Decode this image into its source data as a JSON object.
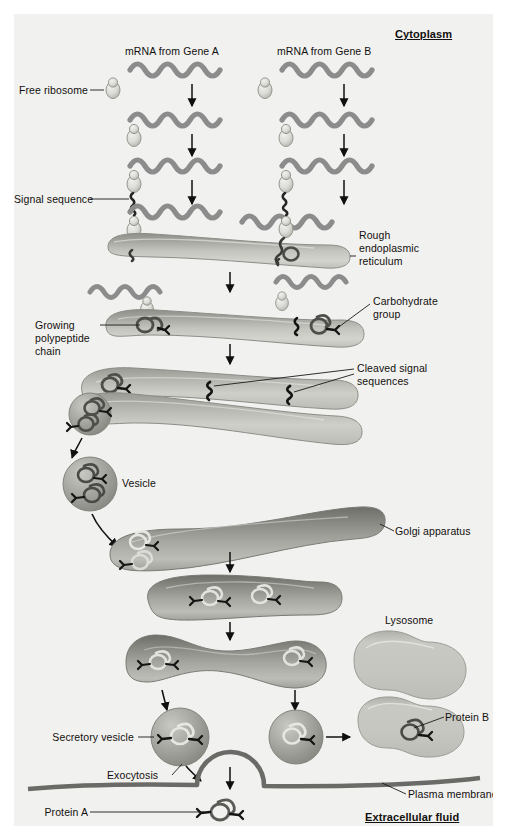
{
  "figure": {
    "type": "biology-process-diagram",
    "background_color": "#f1f1ef",
    "canvas": {
      "width": 507,
      "height": 838
    }
  },
  "regions": {
    "cytoplasm_label": "Cytoplasm",
    "extracellular_label": "Extracellular fluid"
  },
  "labels": {
    "mrna_gene_a": "mRNA from Gene A",
    "mrna_gene_b": "mRNA from Gene B",
    "free_ribosome": "Free ribosome",
    "signal_sequence": "Signal sequence",
    "rough_er_line1": "Rough",
    "rough_er_line2": "endoplasmic",
    "rough_er_line3": "reticulum",
    "carbohydrate_line1": "Carbohydrate",
    "carbohydrate_line2": "group",
    "growing_line1": "Growing",
    "growing_line2": "polypeptide",
    "growing_line3": "chain",
    "cleaved_line1": "Cleaved signal",
    "cleaved_line2": "sequences",
    "vesicle": "Vesicle",
    "golgi": "Golgi apparatus",
    "lysosome": "Lysosome",
    "secretory_vesicle": "Secretory vesicle",
    "protein_b": "Protein B",
    "exocytosis": "Exocytosis",
    "plasma_membrane": "Plasma membrane",
    "protein_a": "Protein A"
  },
  "colors": {
    "background": "#f1f1ef",
    "mrna": "#8c8c8c",
    "mrna_dark": "#6f6f6f",
    "ribosome": "#d9d9d6",
    "ribosome_edge": "#9a9a96",
    "er_light": "#cfcfcb",
    "er_mid": "#a9a9a4",
    "er_dark": "#8b8b86",
    "golgi_dark": "#7e7e79",
    "golgi_mid": "#9b9b96",
    "lysosome": "#c2c2bd",
    "protein": "#6b6b66",
    "carbohydrate": "#1c1c1a",
    "membrane": "#6a6a66",
    "arrow": "#101010",
    "leader": "#1a1a1a",
    "text": "#12100e"
  },
  "stages": [
    {
      "id": "s1",
      "name": "free-mrna-transcripts",
      "description": "mRNA from Gene A and Gene B free in cytoplasm"
    },
    {
      "id": "s2",
      "name": "ribosome-binding",
      "description": "Free ribosome binds to mRNA"
    },
    {
      "id": "s3",
      "name": "signal-sequence-synthesis",
      "description": "Signal sequence emerges from ribosome"
    },
    {
      "id": "s4",
      "name": "er-docking",
      "description": "Ribosome docks on rough endoplasmic reticulum"
    },
    {
      "id": "s5",
      "name": "translocation-glycosylation",
      "description": "Growing polypeptide chain enters ER; carbohydrate group added"
    },
    {
      "id": "s6",
      "name": "signal-cleavage",
      "description": "Cleaved signal sequences inside ER lumen"
    },
    {
      "id": "s7",
      "name": "transport-vesicle",
      "description": "Vesicle buds from ER"
    },
    {
      "id": "s8",
      "name": "golgi-processing",
      "description": "Vesicle fuses with Golgi apparatus"
    },
    {
      "id": "s9",
      "name": "golgi-sorting",
      "description": "Proteins sorted into secretory vesicle and lysosome-bound vesicle"
    },
    {
      "id": "s10",
      "name": "exocytosis",
      "description": "Secretory vesicle fuses with plasma membrane releasing Protein A"
    },
    {
      "id": "s11",
      "name": "lysosome-delivery",
      "description": "Protein B delivered to lysosome"
    }
  ],
  "arrow_count": {
    "vertical": 12,
    "curved": 3
  }
}
